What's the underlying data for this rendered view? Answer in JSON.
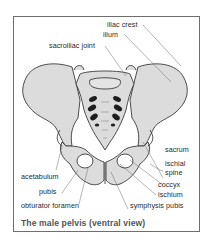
{
  "figure": {
    "title": "The male pelvis (ventral view)",
    "colors": {
      "bone_fill": "#dcdcdc",
      "bone_outline": "#3a3a3a",
      "foramina": "#1e1e1e",
      "leader_line": "#6a6a6a",
      "frame": "#6e6e6e",
      "caption": "#555555"
    },
    "labels": {
      "iliac_crest": "iliac crest",
      "ilium": "ilium",
      "sacroiliac_joint": "sacroiliac joint",
      "sacrum": "sacrum",
      "ischial_spine_line1": "ischial",
      "ischial_spine_line2": "spine",
      "coccyx": "coccyx",
      "ischium": "ischium",
      "acetabulum": "acetabulum",
      "pubis": "pubis",
      "obturator_foramen": "obturator foramen",
      "symphysis_pubis": "symphysis pubis"
    }
  }
}
